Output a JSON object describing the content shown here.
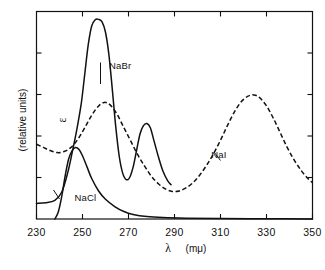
{
  "chart_data": {
    "type": "line",
    "title": "",
    "xlabel": "λ  (mμ)",
    "xlabel_symbol": "λ",
    "xlabel_units": "(mμ)",
    "ylabel": "ε  (relative units)",
    "ylabel_symbol": "ε",
    "ylabel_units": "(relative units)",
    "xlim": [
      230,
      350
    ],
    "ylim": [
      0,
      1
    ],
    "xticks": [
      230,
      250,
      270,
      290,
      310,
      330,
      350
    ],
    "xtick_labels": [
      "230",
      "250",
      "270",
      "290",
      "310",
      "330",
      "350"
    ],
    "yticks": [
      0.2,
      0.4,
      0.6,
      0.8
    ],
    "ytick_labels": [
      "",
      "",
      "",
      ""
    ],
    "grid": false,
    "legend": "inline-annotations",
    "series": [
      {
        "name": "NaCl",
        "style": "solid",
        "label_x": 246.5,
        "label_y": 0.085,
        "points": [
          [
            238.0,
            0.0
          ],
          [
            239.5,
            0.035
          ],
          [
            241.0,
            0.11
          ],
          [
            242.5,
            0.21
          ],
          [
            244.0,
            0.29
          ],
          [
            245.5,
            0.33
          ],
          [
            247.0,
            0.345
          ],
          [
            248.5,
            0.335
          ],
          [
            250.0,
            0.305
          ],
          [
            252.0,
            0.25
          ],
          [
            254.0,
            0.195
          ],
          [
            257.0,
            0.135
          ],
          [
            260.0,
            0.095
          ],
          [
            264.0,
            0.06
          ],
          [
            268.0,
            0.036
          ],
          [
            272.0,
            0.022
          ],
          [
            278.0,
            0.012
          ],
          [
            285.0,
            0.007
          ],
          [
            295.0,
            0.004
          ],
          [
            310.0,
            0.002
          ],
          [
            330.0,
            0.001
          ],
          [
            350.0,
            0.0
          ]
        ]
      },
      {
        "name": "NaBr",
        "style": "solid",
        "label_x": 261.5,
        "label_y": 0.725,
        "points": [
          [
            230.0,
            0.075
          ],
          [
            234.0,
            0.078
          ],
          [
            238.0,
            0.09
          ],
          [
            241.0,
            0.13
          ],
          [
            243.5,
            0.22
          ],
          [
            245.5,
            0.32
          ],
          [
            247.5,
            0.43
          ],
          [
            249.5,
            0.56
          ],
          [
            251.0,
            0.7
          ],
          [
            252.5,
            0.84
          ],
          [
            254.0,
            0.93
          ],
          [
            255.5,
            0.96
          ],
          [
            257.0,
            0.962
          ],
          [
            258.5,
            0.95
          ],
          [
            260.0,
            0.9
          ],
          [
            261.5,
            0.79
          ],
          [
            263.0,
            0.62
          ],
          [
            264.5,
            0.44
          ],
          [
            266.0,
            0.3
          ],
          [
            267.5,
            0.22
          ],
          [
            269.0,
            0.19
          ],
          [
            270.5,
            0.2
          ],
          [
            272.0,
            0.25
          ],
          [
            273.5,
            0.33
          ],
          [
            275.0,
            0.41
          ],
          [
            276.5,
            0.45
          ],
          [
            278.0,
            0.46
          ],
          [
            279.5,
            0.44
          ],
          [
            281.0,
            0.38
          ],
          [
            283.0,
            0.3
          ],
          [
            285.0,
            0.23
          ],
          [
            287.0,
            0.185
          ],
          [
            288.5,
            0.165
          ]
        ]
      },
      {
        "name": "NaI",
        "style": "dashed",
        "label_x": 306.0,
        "label_y": 0.295,
        "points": [
          [
            230.0,
            0.36
          ],
          [
            233.0,
            0.345
          ],
          [
            236.0,
            0.33
          ],
          [
            239.0,
            0.32
          ],
          [
            242.0,
            0.325
          ],
          [
            245.0,
            0.345
          ],
          [
            248.0,
            0.385
          ],
          [
            251.0,
            0.44
          ],
          [
            254.0,
            0.5
          ],
          [
            257.0,
            0.545
          ],
          [
            259.5,
            0.562
          ],
          [
            262.0,
            0.55
          ],
          [
            265.0,
            0.505
          ],
          [
            268.0,
            0.44
          ],
          [
            271.0,
            0.375
          ],
          [
            274.0,
            0.31
          ],
          [
            277.0,
            0.255
          ],
          [
            280.0,
            0.205
          ],
          [
            283.0,
            0.17
          ],
          [
            286.0,
            0.145
          ],
          [
            289.0,
            0.133
          ],
          [
            292.0,
            0.135
          ],
          [
            295.0,
            0.15
          ],
          [
            298.0,
            0.175
          ],
          [
            301.0,
            0.212
          ],
          [
            304.0,
            0.26
          ],
          [
            307.0,
            0.315
          ],
          [
            310.0,
            0.38
          ],
          [
            313.0,
            0.45
          ],
          [
            316.0,
            0.515
          ],
          [
            319.0,
            0.565
          ],
          [
            322.0,
            0.592
          ],
          [
            324.5,
            0.598
          ],
          [
            327.0,
            0.585
          ],
          [
            330.0,
            0.545
          ],
          [
            333.0,
            0.485
          ],
          [
            336.0,
            0.415
          ],
          [
            339.0,
            0.345
          ],
          [
            342.0,
            0.285
          ],
          [
            345.0,
            0.235
          ],
          [
            348.0,
            0.195
          ],
          [
            350.0,
            0.175
          ]
        ]
      }
    ]
  }
}
